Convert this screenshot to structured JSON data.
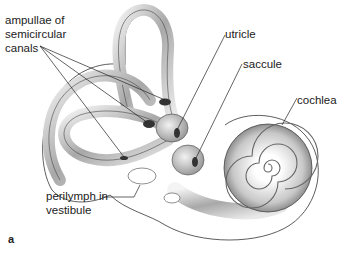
{
  "figure": {
    "panel_label": "a",
    "colors": {
      "ink": "#222222",
      "shade_dark": "#555555",
      "shade_mid": "#9a9a9a",
      "shade_light": "#e2e2e2",
      "background": "#ffffff"
    }
  },
  "labels": {
    "ampullae": {
      "line1": "ampullae of",
      "line2": "semicircular",
      "line3": "canals"
    },
    "utricle": "utricle",
    "saccule": "saccule",
    "cochlea": "cochlea",
    "perilymph": {
      "line1": "perilymph in",
      "line2": "vestibule"
    }
  }
}
